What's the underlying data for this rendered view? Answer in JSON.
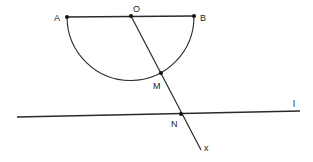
{
  "diagram": {
    "stroke_color": "#2a2a2a",
    "background": "#ffffff",
    "points": [
      {
        "id": "A",
        "label": "A",
        "x": 67,
        "y": 17
      },
      {
        "id": "O",
        "label": "O",
        "x": 131,
        "y": 16
      },
      {
        "id": "B",
        "label": "B",
        "x": 194,
        "y": 16
      },
      {
        "id": "M",
        "label": "M",
        "x": 161,
        "y": 73
      },
      {
        "id": "N",
        "label": "N",
        "x": 181,
        "y": 114
      }
    ],
    "line_label": "l",
    "ray_label": "x",
    "elements": [
      {
        "type": "segment",
        "from": "A",
        "to": "B"
      },
      {
        "type": "semicircle",
        "center": "O",
        "endpoints": [
          "A",
          "B"
        ],
        "side": "below"
      },
      {
        "type": "ray",
        "from": "O",
        "through": [
          "M",
          "N"
        ],
        "label": "x"
      },
      {
        "type": "line",
        "name": "l",
        "passes_through": "N"
      }
    ]
  }
}
